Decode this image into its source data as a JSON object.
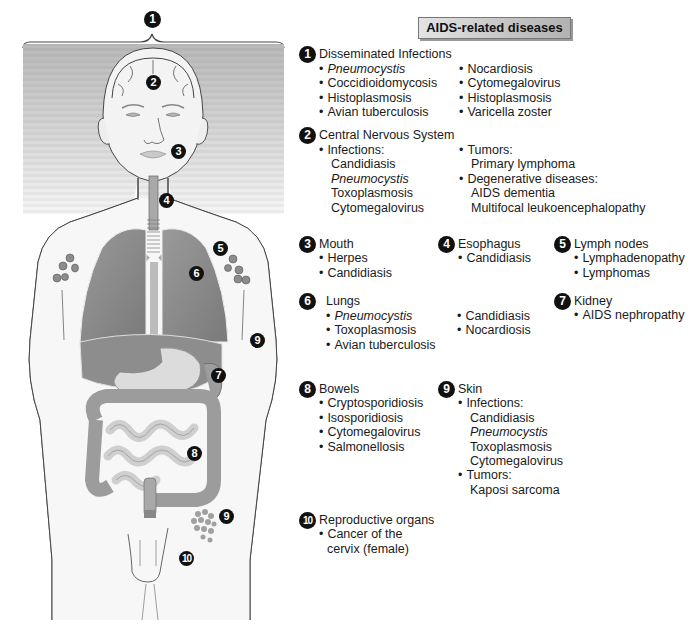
{
  "figure": {
    "alt": "Front view of a human body illustrating organs affected by AIDS-related diseases",
    "markers": [
      {
        "num": "1",
        "label": "Disseminated Infections",
        "x": 144,
        "y": 11
      },
      {
        "num": "2",
        "label": "Central Nervous System",
        "x": 145,
        "y": 75
      },
      {
        "num": "3",
        "label": "Mouth",
        "x": 170,
        "y": 144
      },
      {
        "num": "4",
        "label": "Esophagus",
        "x": 159,
        "y": 193
      },
      {
        "num": "5",
        "label": "Lymph nodes",
        "x": 213,
        "y": 241
      },
      {
        "num": "6",
        "label": "Lungs",
        "x": 189,
        "y": 266
      },
      {
        "num": "7",
        "label": "Kidney",
        "x": 211,
        "y": 367
      },
      {
        "num": "8",
        "label": "Bowels",
        "x": 187,
        "y": 446
      },
      {
        "num": "9",
        "label": "Skin",
        "x": 250,
        "y": 332
      },
      {
        "num": "9",
        "label": "Skin",
        "x": 218,
        "y": 509
      },
      {
        "num": "10",
        "label": "Reproductive organs",
        "x": 179,
        "y": 550
      }
    ]
  },
  "title": "AIDS-related diseases",
  "sections": {
    "disseminated": {
      "num": "1",
      "heading": "Disseminated Infections",
      "col1": [
        {
          "text": "Pneumocystis",
          "italic": true
        },
        {
          "text": "Coccidioidomycosis"
        },
        {
          "text": "Histoplasmosis"
        },
        {
          "text": "Avian tuberculosis"
        }
      ],
      "col2": [
        {
          "text": "Nocardiosis"
        },
        {
          "text": "Cytomegalovirus"
        },
        {
          "text": "Histoplasmosis"
        },
        {
          "text": "Varicella zoster"
        }
      ]
    },
    "cns": {
      "num": "2",
      "heading": "Central Nervous System",
      "infections_label": "Infections:",
      "infections": [
        "Candidiasis",
        "Pneumocystis",
        "Toxoplasmosis",
        "Cytomegalovirus"
      ],
      "tumors_label": "Tumors:",
      "tumors": [
        "Primary lymphoma"
      ],
      "degenerative_label": "Degenerative diseases:",
      "degenerative": [
        "AIDS dementia",
        "Multifocal leukoencephalopathy"
      ]
    },
    "mouth": {
      "num": "3",
      "heading": "Mouth",
      "items": [
        "Herpes",
        "Candidiasis"
      ]
    },
    "esophagus": {
      "num": "4",
      "heading": "Esophagus",
      "items": [
        "Candidiasis"
      ]
    },
    "lymph": {
      "num": "5",
      "heading": "Lymph nodes",
      "items": [
        "Lymphadenopathy",
        "Lymphomas"
      ]
    },
    "lungs": {
      "num": "6",
      "heading": "Lungs",
      "col1": [
        "Pneumocystis",
        "Toxoplasmosis",
        "Avian tuberculosis"
      ],
      "col2": [
        "Candidiasis",
        "Nocardiosis"
      ]
    },
    "kidney": {
      "num": "7",
      "heading": "Kidney",
      "items": [
        "AIDS nephropathy"
      ]
    },
    "bowels": {
      "num": "8",
      "heading": "Bowels",
      "items": [
        "Cryptosporidiosis",
        "Isosporidiosis",
        "Cytomegalovirus",
        "Salmonellosis"
      ]
    },
    "skin": {
      "num": "9",
      "heading": "Skin",
      "infections_label": "Infections:",
      "infections": [
        "Candidiasis",
        "Pneumocystis",
        "Toxoplasmosis",
        "Cytomegalovirus"
      ],
      "tumors_label": "Tumors:",
      "tumors": [
        "Kaposi sarcoma"
      ]
    },
    "reproductive": {
      "num": "10",
      "heading": "Reproductive organs",
      "items": [
        "Cancer of the",
        "cervix (female)"
      ]
    }
  },
  "colors": {
    "badge": "#111111",
    "organ_dark": "#7d7d7d",
    "organ_light": "#d6d6d6",
    "band_bg": "#bdbdbd",
    "title_bg": "#c4c4c4"
  }
}
